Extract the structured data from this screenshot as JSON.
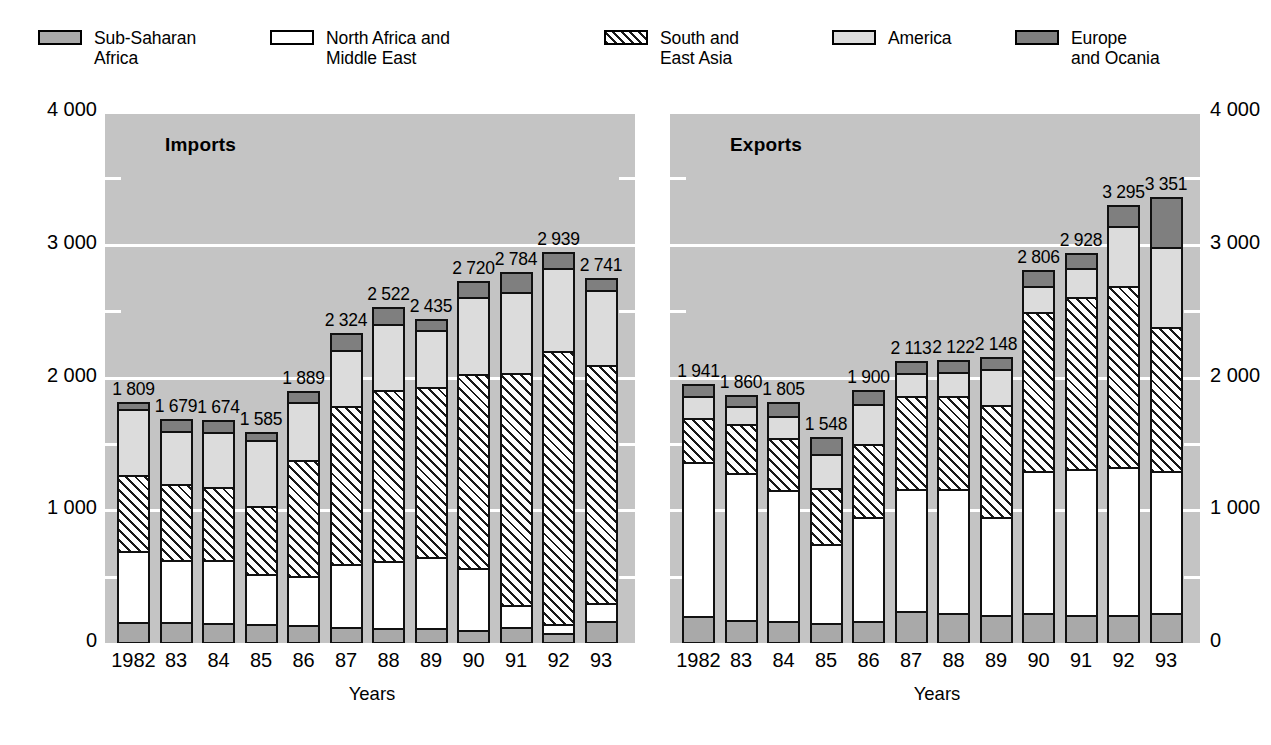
{
  "legend": {
    "items": [
      {
        "name": "Sub-Saharan Africa",
        "label": "Sub-Saharan\nAfrica",
        "swatch": "sub-saharan-africa-swatch",
        "color": "#a9a9a9",
        "pattern": "solid-mid-gray"
      },
      {
        "name": "North Africa and Middle East",
        "label": "North Africa and\nMiddle East",
        "swatch": "north-africa-middle-east-swatch",
        "color": "#ffffff",
        "pattern": "solid-white"
      },
      {
        "name": "South and East Asia",
        "label": "South and\nEast Asia",
        "swatch": "south-east-asia-swatch",
        "color": "#ffffff",
        "pattern": "diagonal-hatch"
      },
      {
        "name": "America",
        "label": "America",
        "swatch": "america-swatch",
        "color": "#dcdcdc",
        "pattern": "solid-light-gray"
      },
      {
        "name": "Europe and Ocania",
        "label": "Europe\nand Ocania",
        "swatch": "europe-ocania-swatch",
        "color": "#7f7f7f",
        "pattern": "solid-dark-gray"
      }
    ]
  },
  "charts": {
    "left": {
      "title": "Imports",
      "xlabel": "Years",
      "ylabels": [
        "4 000",
        "3 000",
        "2 000",
        "1 000",
        "0"
      ]
    },
    "right": {
      "title": "Exports",
      "xlabel": "Years",
      "ylabels": [
        "4 000",
        "3 000",
        "2 000",
        "1 000",
        "0"
      ]
    }
  },
  "chart_data": [
    {
      "type": "bar",
      "title": "Imports",
      "subtitle": "",
      "stacked": true,
      "xlabel": "Years",
      "ylabel": "",
      "ylim": [
        0,
        4000
      ],
      "yticks": [
        0,
        1000,
        2000,
        3000,
        4000
      ],
      "yticklabels": [
        "0",
        "1 000",
        "2 000",
        "3 000",
        "4 000"
      ],
      "minor_yticks": [
        500,
        1500,
        2500,
        3500
      ],
      "grid": true,
      "legend_position": "top",
      "categories": [
        "1982",
        "83",
        "84",
        "85",
        "86",
        "87",
        "88",
        "89",
        "90",
        "91",
        "92",
        "93"
      ],
      "series": [
        {
          "name": "Sub-Saharan Africa",
          "values": [
            152,
            148,
            145,
            135,
            128,
            110,
            108,
            108,
            92,
            116,
            70,
            160
          ]
        },
        {
          "name": "North Africa and Middle East",
          "values": [
            530,
            470,
            470,
            375,
            370,
            480,
            500,
            530,
            465,
            165,
            65,
            135
          ]
        },
        {
          "name": "South and East Asia",
          "values": [
            575,
            575,
            550,
            515,
            870,
            1190,
            1290,
            1280,
            1460,
            1745,
            2060,
            1790
          ]
        },
        {
          "name": "America",
          "values": [
            495,
            400,
            420,
            495,
            440,
            420,
            500,
            430,
            580,
            610,
            620,
            565
          ]
        },
        {
          "name": "Europe and Ocania",
          "values": [
            57,
            86,
            89,
            65,
            81,
            124,
            124,
            87,
            123,
            148,
            124,
            91
          ]
        }
      ],
      "totals": [
        1809,
        1679,
        1674,
        1585,
        1889,
        2324,
        2522,
        2435,
        2720,
        2784,
        2939,
        2741
      ],
      "total_labels": [
        "1 809",
        "1 679",
        "1 674",
        "1 585",
        "1 889",
        "2 324",
        "2 522",
        "2 435",
        "2 720",
        "2 784",
        "2 939",
        "2 741"
      ]
    },
    {
      "type": "bar",
      "title": "Exports",
      "subtitle": "",
      "stacked": true,
      "xlabel": "Years",
      "ylabel": "",
      "ylim": [
        0,
        4000
      ],
      "yticks": [
        0,
        1000,
        2000,
        3000,
        4000
      ],
      "yticklabels": [
        "0",
        "1 000",
        "2 000",
        "3 000",
        "4 000"
      ],
      "minor_yticks": [
        500,
        1500,
        2500,
        3500
      ],
      "grid": true,
      "legend_position": "top",
      "categories": [
        "1982",
        "83",
        "84",
        "85",
        "86",
        "87",
        "88",
        "89",
        "90",
        "91",
        "92",
        "93"
      ],
      "series": [
        {
          "name": "Sub-Saharan Africa",
          "values": [
            195,
            165,
            160,
            140,
            155,
            230,
            215,
            200,
            215,
            200,
            205,
            215
          ]
        },
        {
          "name": "North Africa and Middle East",
          "values": [
            1160,
            1105,
            985,
            600,
            790,
            920,
            940,
            745,
            1070,
            1100,
            1110,
            1070
          ]
        },
        {
          "name": "South and East Asia",
          "values": [
            330,
            370,
            390,
            420,
            545,
            700,
            700,
            840,
            1200,
            1300,
            1370,
            1090
          ]
        },
        {
          "name": "America",
          "values": [
            170,
            140,
            170,
            255,
            300,
            180,
            180,
            270,
            200,
            215,
            450,
            600
          ]
        },
        {
          "name": "Europe and Ocania",
          "values": [
            86,
            80,
            100,
            133,
            110,
            83,
            87,
            93,
            121,
            113,
            160,
            376
          ]
        }
      ],
      "totals": [
        1941,
        1860,
        1805,
        1548,
        1900,
        2113,
        2122,
        2148,
        2806,
        2928,
        3295,
        3351
      ],
      "total_labels": [
        "1 941",
        "1 860",
        "1 805",
        "1 548",
        "1 900",
        "2 113",
        "2 122",
        "2 148",
        "2 806",
        "2 928",
        "3 295",
        "3 351"
      ]
    }
  ]
}
